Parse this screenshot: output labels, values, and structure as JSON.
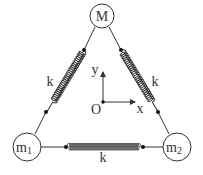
{
  "diagram": {
    "masses": [
      {
        "id": "M",
        "label": "M",
        "sub": "",
        "cx": 102,
        "cy": 16,
        "r": 12
      },
      {
        "id": "m1",
        "label": "m",
        "sub": "1",
        "cx": 27,
        "cy": 147,
        "r": 14
      },
      {
        "id": "m2",
        "label": "m",
        "sub": "2",
        "cx": 177,
        "cy": 147,
        "r": 14
      }
    ],
    "springs": [
      {
        "id": "left",
        "label": "k",
        "from": "M",
        "to": "m1"
      },
      {
        "id": "right",
        "label": "k",
        "from": "M",
        "to": "m2"
      },
      {
        "id": "bottom",
        "label": "k",
        "from": "m1",
        "to": "m2"
      }
    ],
    "axes": {
      "origin_label": "O",
      "x_label": "x",
      "y_label": "y"
    },
    "colors": {
      "stroke": "#333333",
      "background": "#ffffff"
    }
  }
}
